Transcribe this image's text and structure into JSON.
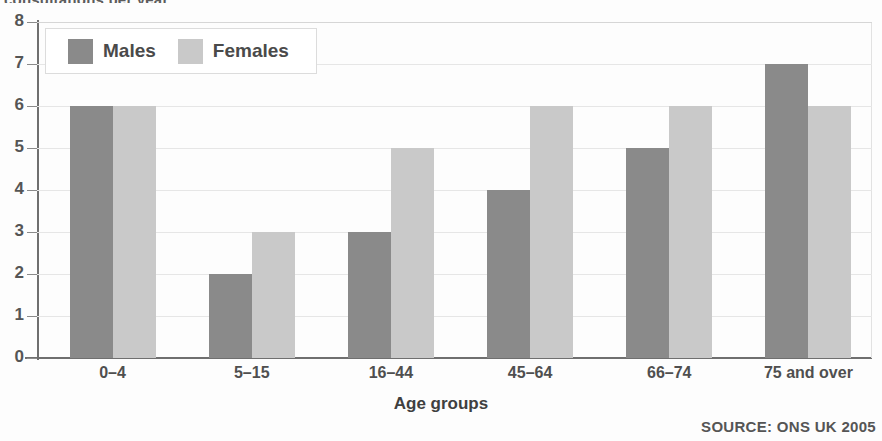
{
  "title_clipped": "consultations per year",
  "axis_title": "Age groups",
  "source_note": "SOURCE: ONS UK 2005",
  "legend": {
    "items": [
      {
        "label": "Males",
        "color": "#8a8a8a"
      },
      {
        "label": "Females",
        "color": "#c9c9c9"
      }
    ]
  },
  "y_ticks": [
    "0",
    "1",
    "2",
    "3",
    "4",
    "5",
    "6",
    "7",
    "8"
  ],
  "chart_data": {
    "type": "bar",
    "title": "consultations per year",
    "xlabel": "Age groups",
    "ylabel": "",
    "ylim": [
      0,
      8
    ],
    "grid": true,
    "legend_position": "top-left",
    "annotations": [
      "SOURCE: ONS UK 2005"
    ],
    "categories": [
      "0–4",
      "5–15",
      "16–44",
      "45–64",
      "66–74",
      "75 and over"
    ],
    "series": [
      {
        "name": "Males",
        "color": "#8a8a8a",
        "values": [
          6,
          2,
          3,
          4,
          5,
          7
        ]
      },
      {
        "name": "Females",
        "color": "#c9c9c9",
        "values": [
          6,
          3,
          5,
          6,
          6,
          6
        ]
      }
    ]
  }
}
